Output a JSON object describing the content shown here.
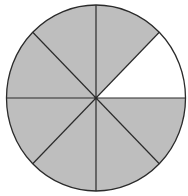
{
  "diagram": {
    "type": "fraction-circle",
    "total_parts": 8,
    "shaded_parts": 7,
    "unshaded_parts": 1,
    "fraction_shaded": "7/8",
    "unshaded_sector_index": 0,
    "colors": {
      "shaded": "#bebebe",
      "unshaded": "#ffffff",
      "stroke": "#2b2b2b"
    }
  }
}
